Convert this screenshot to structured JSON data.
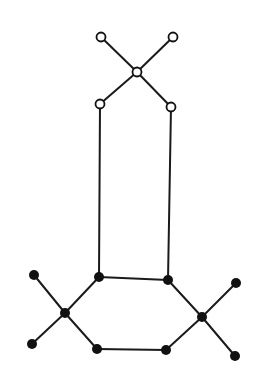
{
  "diagram": {
    "type": "graph",
    "width": 272,
    "height": 384,
    "background": "#ffffff",
    "edge_color": "#1a1a1a",
    "edge_width": 2,
    "node_radius": 4.5,
    "node_fill_color": "#111111",
    "node_hollow_fill": "#ffffff",
    "nodes": [
      {
        "id": "t_tl",
        "x": 101,
        "y": 37,
        "style": "hollow"
      },
      {
        "id": "t_tr",
        "x": 173,
        "y": 37,
        "style": "hollow"
      },
      {
        "id": "t_c",
        "x": 137,
        "y": 72,
        "style": "hollow"
      },
      {
        "id": "t_bl",
        "x": 100,
        "y": 104,
        "style": "hollow"
      },
      {
        "id": "t_br",
        "x": 171,
        "y": 107,
        "style": "hollow"
      },
      {
        "id": "h_tl",
        "x": 99,
        "y": 277,
        "style": "filled"
      },
      {
        "id": "h_tr",
        "x": 168,
        "y": 280,
        "style": "filled"
      },
      {
        "id": "h_l",
        "x": 65,
        "y": 313,
        "style": "filled"
      },
      {
        "id": "h_r",
        "x": 202,
        "y": 317,
        "style": "filled"
      },
      {
        "id": "h_bl",
        "x": 97,
        "y": 349,
        "style": "filled"
      },
      {
        "id": "h_br",
        "x": 166,
        "y": 350,
        "style": "filled"
      },
      {
        "id": "l_top",
        "x": 34,
        "y": 275,
        "style": "filled"
      },
      {
        "id": "l_bot",
        "x": 32,
        "y": 344,
        "style": "filled"
      },
      {
        "id": "r_top",
        "x": 236,
        "y": 283,
        "style": "filled"
      },
      {
        "id": "r_bot",
        "x": 235,
        "y": 356,
        "style": "filled"
      }
    ],
    "edges": [
      [
        "t_tl",
        "t_c"
      ],
      [
        "t_tr",
        "t_c"
      ],
      [
        "t_c",
        "t_bl"
      ],
      [
        "t_c",
        "t_br"
      ],
      [
        "t_bl",
        "h_tl"
      ],
      [
        "t_br",
        "h_tr"
      ],
      [
        "h_tl",
        "h_tr"
      ],
      [
        "h_tl",
        "h_l"
      ],
      [
        "h_tr",
        "h_r"
      ],
      [
        "h_l",
        "h_bl"
      ],
      [
        "h_r",
        "h_br"
      ],
      [
        "h_bl",
        "h_br"
      ],
      [
        "h_l",
        "l_top"
      ],
      [
        "h_l",
        "l_bot"
      ],
      [
        "h_r",
        "r_top"
      ],
      [
        "h_r",
        "r_bot"
      ]
    ]
  }
}
